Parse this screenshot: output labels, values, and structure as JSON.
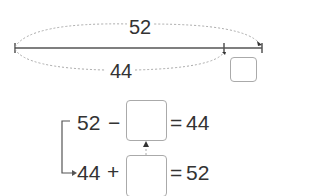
{
  "diagram": {
    "total_label": "52",
    "part_label": "44",
    "equation1": {
      "left": "52",
      "op": "−",
      "equals": "=",
      "result": "44"
    },
    "equation2": {
      "left": "44",
      "op": "+",
      "equals": "=",
      "result": "52"
    }
  },
  "colors": {
    "line": "#555555",
    "dotted": "#aaaaaa",
    "box_border": "#aaaaaa",
    "text": "#333333"
  }
}
